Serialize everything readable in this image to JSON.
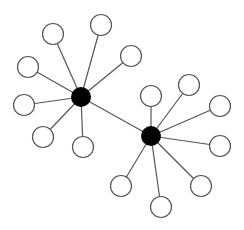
{
  "diagram": {
    "type": "network",
    "width": 244,
    "height": 230,
    "colors": {
      "background": "#ffffff",
      "edge": "#555555",
      "leaf_fill": "#ffffff",
      "leaf_stroke": "#555555",
      "hub_fill": "#000000"
    },
    "hubs": [
      {
        "id": "hub-1",
        "x": 81,
        "y": 97,
        "r": 10
      },
      {
        "id": "hub-2",
        "x": 151,
        "y": 136,
        "r": 10
      }
    ],
    "leaves": [
      {
        "id": "h1-leaf-1",
        "hub": "hub-1",
        "x": 53,
        "y": 34
      },
      {
        "id": "h1-leaf-2",
        "hub": "hub-1",
        "x": 101,
        "y": 25
      },
      {
        "id": "h1-leaf-3",
        "hub": "hub-1",
        "x": 28,
        "y": 67
      },
      {
        "id": "h1-leaf-4",
        "hub": "hub-1",
        "x": 131,
        "y": 56
      },
      {
        "id": "h1-leaf-5",
        "hub": "hub-1",
        "x": 24,
        "y": 105
      },
      {
        "id": "h1-leaf-6",
        "hub": "hub-1",
        "x": 43,
        "y": 137
      },
      {
        "id": "h1-leaf-7",
        "hub": "hub-1",
        "x": 83,
        "y": 147
      },
      {
        "id": "h2-leaf-1",
        "hub": "hub-2",
        "x": 151,
        "y": 96
      },
      {
        "id": "h2-leaf-2",
        "hub": "hub-2",
        "x": 189,
        "y": 85
      },
      {
        "id": "h2-leaf-3",
        "hub": "hub-2",
        "x": 220,
        "y": 106
      },
      {
        "id": "h2-leaf-4",
        "hub": "hub-2",
        "x": 220,
        "y": 146
      },
      {
        "id": "h2-leaf-5",
        "hub": "hub-2",
        "x": 201,
        "y": 186
      },
      {
        "id": "h2-leaf-6",
        "hub": "hub-2",
        "x": 121,
        "y": 186
      },
      {
        "id": "h2-leaf-7",
        "hub": "hub-2",
        "x": 161,
        "y": 207
      }
    ],
    "leaf_radius": 10.5,
    "hub_link": {
      "from": "hub-1",
      "to": "hub-2"
    }
  }
}
